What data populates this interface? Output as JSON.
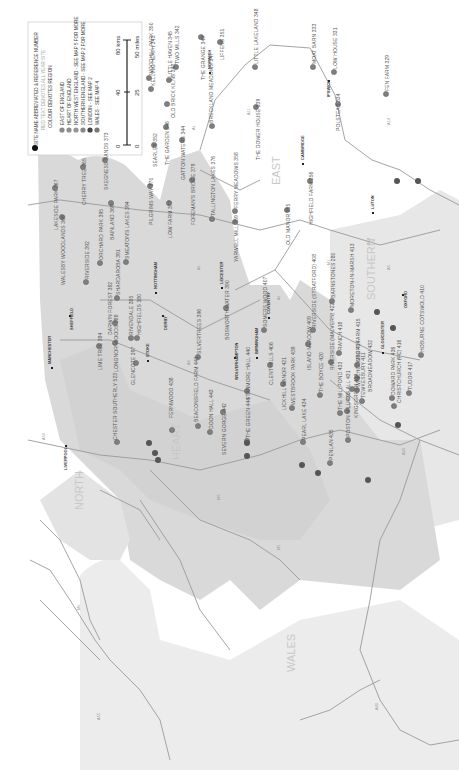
{
  "legend": {
    "title": "SITE NAME ABBREVIATED & REFERENCE NUMBER",
    "red_text_note": "RED TEXT DENOTES ALL YEAR SITE",
    "colour_note": "COLOUR DENOTES REGION",
    "regions": [
      {
        "label": "EAST OF ENGLAND",
        "color": "#8a8a8a"
      },
      {
        "label": "HEART OF ENGLAND",
        "color": "#8f8f8f"
      },
      {
        "label": "NORTH WEST ENGLAND - SEE MAP 5 FOR MORE",
        "color": "#959595"
      },
      {
        "label": "SOUTHERN ENGLAND - SEE MAP 2 FOR MORE",
        "color": "#888888"
      },
      {
        "label": "LONDON - SEE MAP 2",
        "color": "#444444"
      },
      {
        "label": "WALES - SEE MAP 4",
        "color": "#777777"
      }
    ],
    "scale": {
      "km_zero": "0",
      "km_mid": "40",
      "km_max": "80 kms",
      "mi_zero": "0",
      "mi_mid": "25",
      "mi_max": "50 miles"
    }
  },
  "region_labels": {
    "east": "EAST",
    "heart": "HEART",
    "north_west_1": "NORTH",
    "north_west_2": "WEST",
    "southern": "SOUTHERN",
    "wales": "WALES"
  },
  "cities": [
    "MANCHESTER",
    "LIVERPOOL",
    "SHEFFIELD",
    "NOTTINGHAM",
    "DERBY",
    "LEICESTER",
    "COVENTRY",
    "BIRMINGHAM",
    "WOLVERHAMPTON",
    "STOKE",
    "CAMBRIDGE",
    "IPSWICH",
    "NORWICH",
    "LUTON",
    "OXFORD",
    "GLOUCESTER"
  ],
  "roads": [
    "A1",
    "A1",
    "A11",
    "A14",
    "A14",
    "A12",
    "A5",
    "A6",
    "M1",
    "A47",
    "A17",
    "A46",
    "A41",
    "A40",
    "A49",
    "A55",
    "M6",
    "A38"
  ],
  "sites": [
    {
      "name": "WOODHILL PARK 350"
    },
    {
      "name": "KELLING HEATH 343"
    },
    {
      "name": "LITTLE HAVEN 345"
    },
    {
      "name": "TWO MILLS 342"
    },
    {
      "name": "OLD BRICK KILNS 340"
    },
    {
      "name": "THE GRANGE 349"
    },
    {
      "name": "LIFFENS 351"
    },
    {
      "name": "LITTLE LAKELAND 348"
    },
    {
      "name": "BRECKLAND MEADOWS 347"
    },
    {
      "name": "MOAT BARN 333"
    },
    {
      "name": "LOW HOUSE 331"
    },
    {
      "name": "FEN FARM 329"
    },
    {
      "name": "POLSTEAD 334"
    },
    {
      "name": "THE DOWER HOUSE 339"
    },
    {
      "name": "SEARLES 352"
    },
    {
      "name": "THE GARDEN 346"
    },
    {
      "name": "GATTON WATERS 344"
    },
    {
      "name": "LAKESIDE PARK 367"
    },
    {
      "name": "CHERRY TREE 365"
    },
    {
      "name": "SKEGNESS SANDS 373"
    },
    {
      "name": "WALESBY WOODLANDS 366"
    },
    {
      "name": "ORCHARD PARK 395"
    },
    {
      "name": "BAINLAND 369"
    },
    {
      "name": "PILGRIMS WAY 370"
    },
    {
      "name": "LOW FARM 377"
    },
    {
      "name": "FOREMAN'S BRIDGE 379"
    },
    {
      "name": "TALLINGTON LAKES 376"
    },
    {
      "name": "FERRY MEADOWS 358"
    },
    {
      "name": "YARWELL MILL 359"
    },
    {
      "name": "SMEATON'S LAKES 394"
    },
    {
      "name": "RIVERSIDE 392"
    },
    {
      "name": "SHARDAROBA 391"
    },
    {
      "name": "DARWIN FOREST 382"
    },
    {
      "name": "RIVENDALE 385"
    },
    {
      "name": "HIGHFIELDS 380"
    },
    {
      "name": "OLD MANOR 355"
    },
    {
      "name": "HIGHFIELD FARM 356"
    },
    {
      "name": "BOSWORTH WATER 390"
    },
    {
      "name": "SOMERS WOOD 407"
    },
    {
      "name": "SILVERTREES 396"
    },
    {
      "name": "LIME TREE 384"
    },
    {
      "name": "LONGNOR WOODS 388"
    },
    {
      "name": "GLENCOTE 397"
    },
    {
      "name": "CHESTER SOUTHERLY 523"
    },
    {
      "name": "FERNWOOD 438"
    },
    {
      "name": "BEACONSFIELD FARM 441"
    },
    {
      "name": "DOON HALL 443"
    },
    {
      "name": "SEVERN GORGE 442"
    },
    {
      "name": "THE GREEN 444"
    },
    {
      "name": "STANMORE HALL 440"
    },
    {
      "name": "CLENT HILLS 406"
    },
    {
      "name": "LICKHILL MANOR 421"
    },
    {
      "name": "WESTBROOK PARK 439"
    },
    {
      "name": "PEARL LAKE 434"
    },
    {
      "name": "ISLAND MEADOW 409"
    },
    {
      "name": "THE BOYCE 420"
    },
    {
      "name": "RIVERSIDE (STRATFORD) 408"
    },
    {
      "name": "BARNSTONES 280"
    },
    {
      "name": "MORETON-IN-MARSH 413"
    },
    {
      "name": "RIVERSIDE (MALVERN) 422"
    },
    {
      "name": "RANCH 418"
    },
    {
      "name": "CROFT FARM 415"
    },
    {
      "name": "WINCHCOMBE 414"
    },
    {
      "name": "THE MILLPOND 433"
    },
    {
      "name": "LUCKS ALL 431"
    },
    {
      "name": "KINGSGREEN 419"
    },
    {
      "name": "TEWKESBURY 411"
    },
    {
      "name": "BROADMEADOW 432"
    },
    {
      "name": "POSTON MILL 430"
    },
    {
      "name": "PENLAN 435"
    },
    {
      "name": "DOWARD PARK 436"
    },
    {
      "name": "CHRISTCHURCH (FC) 416"
    },
    {
      "name": "TUDOR 417"
    },
    {
      "name": "HOBURNE COTSWOLD 410"
    }
  ]
}
